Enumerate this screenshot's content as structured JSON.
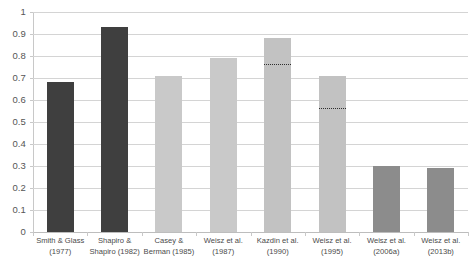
{
  "chart_data": {
    "type": "bar",
    "title": "",
    "subtitle": "",
    "xlabel": "",
    "ylabel": "",
    "ylim": [
      0,
      1
    ],
    "ytick_labels": [
      "1",
      "0.9",
      "0.8",
      "0.7",
      "0.6",
      "0.5",
      "0.4",
      "0.3",
      "0.2",
      "0.1",
      "0"
    ],
    "ytick_values": [
      1,
      0.9,
      0.8,
      0.7,
      0.6,
      0.5,
      0.4,
      0.3,
      0.2,
      0.1,
      0
    ],
    "grid": "horizontal",
    "legend": "none",
    "categories": [
      "Smith & Glass (1977)",
      "Shapiro & Shapiro (1982)",
      "Casey & Berman (1985)",
      "Weisz et al. (1987)",
      "Kazdin et al. (1990)",
      "Weisz et al. (1995)",
      "Weisz et al. (2006a)",
      "Weisz et al. (2013b)"
    ],
    "category_lines": [
      [
        "Smith & Glass",
        "(1977)"
      ],
      [
        "Shapiro &",
        "Shapiro (1982)"
      ],
      [
        "Casey &",
        "Berman (1985)"
      ],
      [
        "Weisz et al.",
        "(1987)"
      ],
      [
        "Kazdin et al.",
        "(1990)"
      ],
      [
        "Weisz et al.",
        "(1995)"
      ],
      [
        "Weisz et al.",
        "(2006a)"
      ],
      [
        "Weisz et al.",
        "(2013b)"
      ]
    ],
    "values": [
      0.68,
      0.93,
      0.71,
      0.79,
      0.88,
      0.71,
      0.3,
      0.29
    ],
    "bar_colors": [
      "#3f3f3f",
      "#3f3f3f",
      "#c9c9c9",
      "#c9c9c9",
      "#c2c2c2",
      "#c2c2c2",
      "#8c8c8c",
      "#8c8c8c"
    ],
    "annotations": [
      {
        "category": "Kazdin et al. (1990)",
        "type": "dotted-line",
        "value": 0.76
      },
      {
        "category": "Weisz et al. (1995)",
        "type": "dotted-line",
        "value": 0.56
      }
    ],
    "colors": {
      "gridline": "#d4d4d4",
      "axis": "#c8c8c8",
      "tick_label": "#555555",
      "category_label": "#4a4a4a",
      "annotation_line": "#2e2e2e",
      "background": "#ffffff"
    }
  }
}
